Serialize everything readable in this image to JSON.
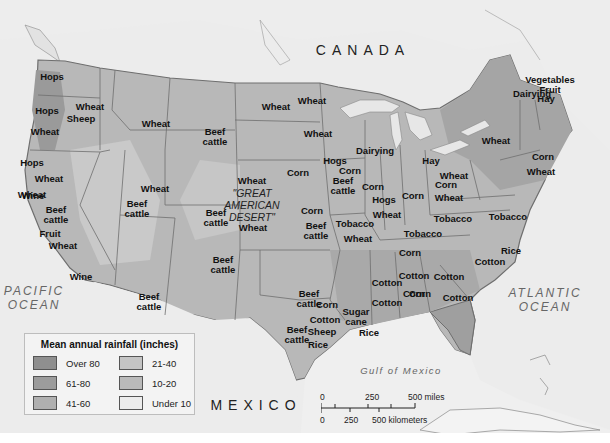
{
  "map": {
    "countries": {
      "canada": "CANADA",
      "mexico": "MEXICO"
    },
    "oceans": {
      "pacific": "PACIFIC\nOCEAN",
      "atlantic": "ATLANTIC\nOCEAN",
      "gulf": "Gulf of Mexico"
    },
    "desert_label": "\"GREAT\nAMERICAN\nDESERT\"",
    "colors": {
      "background": "#ececec",
      "over_80": "#8f8f8f",
      "61_80": "#9e9e9e",
      "41_60": "#b3b3b3",
      "21_40": "#c2c2c2",
      "10_20": "#b8b8b8",
      "under_10": "#ebebeb",
      "border": "#6e6e6e"
    },
    "products": [
      {
        "text": "Hops",
        "x": 52,
        "y": 77
      },
      {
        "text": "Hops",
        "x": 47,
        "y": 111
      },
      {
        "text": "Wheat",
        "x": 90,
        "y": 107
      },
      {
        "text": "Sheep",
        "x": 81,
        "y": 119
      },
      {
        "text": "Wheat",
        "x": 45,
        "y": 132
      },
      {
        "text": "Wheat",
        "x": 156,
        "y": 124
      },
      {
        "text": "Wheat",
        "x": 276,
        "y": 107
      },
      {
        "text": "Wheat",
        "x": 312,
        "y": 101
      },
      {
        "text": "Wheat",
        "x": 318,
        "y": 134
      },
      {
        "text": "Dairying",
        "x": 375,
        "y": 151
      },
      {
        "text": "Beef\ncattle",
        "x": 215,
        "y": 137
      },
      {
        "text": "Hops",
        "x": 32,
        "y": 163
      },
      {
        "text": "Wheat",
        "x": 49,
        "y": 179
      },
      {
        "text": "Wheat",
        "x": 155,
        "y": 189
      },
      {
        "text": "Wheat",
        "x": 252,
        "y": 181
      },
      {
        "text": "Corn",
        "x": 298,
        "y": 173
      },
      {
        "text": "Hogs",
        "x": 335,
        "y": 161
      },
      {
        "text": "Corn",
        "x": 350,
        "y": 171
      },
      {
        "text": "Beef\ncattle",
        "x": 343,
        "y": 186
      },
      {
        "text": "Corn",
        "x": 373,
        "y": 187
      },
      {
        "text": "Hay",
        "x": 431,
        "y": 161
      },
      {
        "text": "Wheat",
        "x": 454,
        "y": 176
      },
      {
        "text": "Corn",
        "x": 446,
        "y": 185
      },
      {
        "text": "Wheat",
        "x": 449,
        "y": 198
      },
      {
        "text": "Corn",
        "x": 413,
        "y": 196
      },
      {
        "text": "Hogs",
        "x": 384,
        "y": 200
      },
      {
        "text": "Wheat",
        "x": 387,
        "y": 215
      },
      {
        "text": "Tobacco",
        "x": 453,
        "y": 219
      },
      {
        "text": "Tobacco",
        "x": 508,
        "y": 217
      },
      {
        "text": "Tobacco",
        "x": 423,
        "y": 234
      },
      {
        "text": "Corn",
        "x": 410,
        "y": 253
      },
      {
        "text": "Wheat",
        "x": 32,
        "y": 195
      },
      {
        "text": "Wine",
        "x": 33,
        "y": 196
      },
      {
        "text": "Beef\ncattle",
        "x": 56,
        "y": 215
      },
      {
        "text": "Fruit",
        "x": 50,
        "y": 234
      },
      {
        "text": "Wheat",
        "x": 63,
        "y": 246
      },
      {
        "text": "Wine",
        "x": 81,
        "y": 277
      },
      {
        "text": "Beef\ncattle",
        "x": 137,
        "y": 209
      },
      {
        "text": "Beef\ncattle",
        "x": 216,
        "y": 218
      },
      {
        "text": "Wheat",
        "x": 253,
        "y": 228
      },
      {
        "text": "Corn",
        "x": 312,
        "y": 211
      },
      {
        "text": "Beef\ncattle",
        "x": 316,
        "y": 231
      },
      {
        "text": "Tobacco",
        "x": 355,
        "y": 224
      },
      {
        "text": "Wheat",
        "x": 358,
        "y": 239
      },
      {
        "text": "Beef\ncattle",
        "x": 223,
        "y": 265
      },
      {
        "text": "Beef\ncattle",
        "x": 149,
        "y": 302
      },
      {
        "text": "Corn",
        "x": 543,
        "y": 157
      },
      {
        "text": "Wheat",
        "x": 541,
        "y": 172
      },
      {
        "text": "Wheat",
        "x": 496,
        "y": 141
      },
      {
        "text": "Dairying",
        "x": 532,
        "y": 94
      },
      {
        "text": "Vegetables\nFruit",
        "x": 550,
        "y": 85
      },
      {
        "text": "Hay",
        "x": 546,
        "y": 99
      },
      {
        "text": "Rice",
        "x": 511,
        "y": 251
      },
      {
        "text": "Cotton",
        "x": 490,
        "y": 262
      },
      {
        "text": "Cotton",
        "x": 414,
        "y": 276
      },
      {
        "text": "Cotton",
        "x": 449,
        "y": 277
      },
      {
        "text": "Corn",
        "x": 414,
        "y": 294
      },
      {
        "text": "Cotton",
        "x": 458,
        "y": 298
      },
      {
        "text": "Cotton",
        "x": 387,
        "y": 283
      },
      {
        "text": "Cotton",
        "x": 387,
        "y": 303
      },
      {
        "text": "Corn",
        "x": 420,
        "y": 294
      },
      {
        "text": "Beef\ncattle",
        "x": 309,
        "y": 299
      },
      {
        "text": "Corn",
        "x": 327,
        "y": 305
      },
      {
        "text": "Cotton",
        "x": 325,
        "y": 320
      },
      {
        "text": "Beef\ncattle",
        "x": 297,
        "y": 335
      },
      {
        "text": "Sheep",
        "x": 322,
        "y": 332
      },
      {
        "text": "Rice",
        "x": 318,
        "y": 345
      },
      {
        "text": "Sugar\ncane",
        "x": 356,
        "y": 317
      },
      {
        "text": "Rice",
        "x": 369,
        "y": 333
      }
    ]
  },
  "legend": {
    "title": "Mean annual rainfall (inches)",
    "items": [
      {
        "label": "Over 80",
        "color": "#8f8f8f"
      },
      {
        "label": "61-80",
        "color": "#9c9c9c"
      },
      {
        "label": "41-60",
        "color": "#b0b0b0"
      },
      {
        "label": "21-40",
        "color": "#c4c4c4"
      },
      {
        "label": "10-20",
        "color": "#bababa"
      },
      {
        "label": "Under 10",
        "color": "#ececec"
      }
    ]
  },
  "scale_bar": {
    "miles_0": "0",
    "miles_250": "250",
    "miles_500": "500 miles",
    "km_0": "0",
    "km_250": "250",
    "km_500": "500 kilometers"
  }
}
